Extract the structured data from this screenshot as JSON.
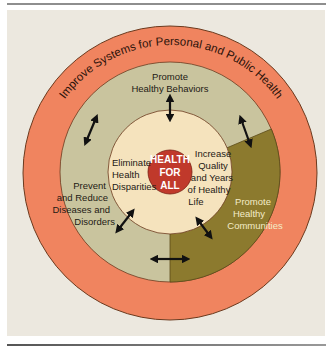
{
  "colors": {
    "background": "#ece8df",
    "outer_ring": "#f0845f",
    "middle_ring": "#c9c49e",
    "olive_section": "#8c7a2e",
    "inner_circle": "#f5e3bd",
    "center_circle": "#c0392b",
    "outline": "#6b3a1e"
  },
  "outer_ring": {
    "label": "Improve Systems for Personal and Public Health"
  },
  "middle_ring": {
    "segments": [
      {
        "label_lines": [
          "Promote",
          "Healthy Behaviors"
        ]
      },
      {
        "label_lines": [
          "Prevent",
          "and Reduce",
          "Diseases and",
          "Disorders"
        ]
      },
      {
        "label_lines": [
          "Promote",
          "Healthy",
          "Communities"
        ]
      }
    ]
  },
  "inner_circle": {
    "goals": [
      {
        "label_lines": [
          "Eliminate",
          "Health",
          "Disparities"
        ]
      },
      {
        "label_lines": [
          "Increase",
          "Quality",
          "and Years",
          "of Healthy",
          "Life"
        ]
      }
    ]
  },
  "center": {
    "label_lines": [
      "HEALTH",
      "FOR",
      "ALL"
    ]
  },
  "arrows": [
    "double-arrow-top",
    "double-arrow-upper-left",
    "double-arrow-upper-right",
    "double-arrow-lower-left",
    "double-arrow-lower-right",
    "double-arrow-bottom"
  ]
}
